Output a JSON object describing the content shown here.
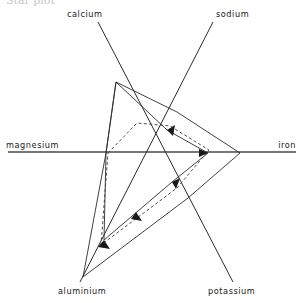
{
  "figure": {
    "title_fragment": "Star plot",
    "background_color": "#ffffff",
    "line_color": "#2b2b2b",
    "axis_color": "#4a4a4a"
  },
  "axes_labels": {
    "calcium": "calcium",
    "sodium": "sodium",
    "iron": "iron",
    "potassium": "potassium",
    "aluminium": "aluminium",
    "magnesium": "magnesium"
  },
  "chart_data": {
    "type": "line",
    "subtype": "star-plot",
    "title": "",
    "xlabel": "",
    "ylabel": "",
    "grid": false,
    "legend_position": "none",
    "center": {
      "x": 152,
      "y": 152
    },
    "axis_order": [
      "magnesium",
      "calcium",
      "sodium",
      "iron",
      "potassium",
      "aluminium"
    ],
    "axis_angles_deg": {
      "magnesium": 180,
      "calcium": 118,
      "sodium": 56,
      "iron": 0,
      "potassium": -56,
      "aluminium": -118
    },
    "axis_endpoints": {
      "magnesium": {
        "x": 8,
        "y": 152
      },
      "calcium": {
        "x": 98,
        "y": 22
      },
      "sodium": {
        "x": 213,
        "y": 22
      },
      "iron": {
        "x": 296,
        "y": 152
      },
      "potassium": {
        "x": 233,
        "y": 282
      },
      "aluminium": {
        "x": 80,
        "y": 282
      }
    },
    "categories": [
      "magnesium",
      "calcium",
      "sodium",
      "iron",
      "potassium",
      "aluminium"
    ],
    "series": [
      {
        "name": "sample-1",
        "style": "solid",
        "values": [
          0.32,
          0.74,
          0.36,
          0.61,
          0.34,
          0.97
        ],
        "points": [
          {
            "axis": "magnesium",
            "x": 106,
            "y": 153
          },
          {
            "axis": "calcium",
            "x": 116,
            "y": 82
          },
          {
            "axis": "sodium",
            "x": 177,
            "y": 112
          },
          {
            "axis": "iron",
            "x": 240,
            "y": 153
          },
          {
            "axis": "potassium",
            "x": 188,
            "y": 198
          },
          {
            "axis": "aluminium",
            "x": 83,
            "y": 277
          }
        ]
      },
      {
        "name": "sample-2",
        "style": "solid",
        "values": [
          0.32,
          0.74,
          0.14,
          0.4,
          0.22,
          0.82
        ],
        "points": [
          {
            "axis": "magnesium",
            "x": 106,
            "y": 153
          },
          {
            "axis": "calcium",
            "x": 116,
            "y": 82
          },
          {
            "axis": "sodium",
            "x": 167,
            "y": 130
          },
          {
            "axis": "iron",
            "x": 208,
            "y": 153
          },
          {
            "axis": "potassium",
            "x": 172,
            "y": 182
          },
          {
            "axis": "aluminium",
            "x": 104,
            "y": 240
          }
        ]
      },
      {
        "name": "sample-3",
        "style": "dashed",
        "values": [
          0.3,
          0.42,
          0.19,
          0.4,
          0.26,
          0.84
        ],
        "points": [
          {
            "axis": "magnesium",
            "x": 108,
            "y": 153
          },
          {
            "axis": "calcium",
            "x": 137,
            "y": 123
          },
          {
            "axis": "sodium",
            "x": 170,
            "y": 126
          },
          {
            "axis": "iron",
            "x": 209,
            "y": 150
          },
          {
            "axis": "potassium",
            "x": 177,
            "y": 188
          },
          {
            "axis": "aluminium",
            "x": 101,
            "y": 245
          }
        ]
      }
    ],
    "annotations": [
      {
        "name": "arrow-aluminium-inner",
        "x": 104,
        "y": 240,
        "angle_deg": 62
      },
      {
        "name": "arrow-potassium-inner",
        "x": 172,
        "y": 182,
        "angle_deg": 236
      },
      {
        "name": "arrow-sodium-inner",
        "x": 167,
        "y": 130,
        "angle_deg": 208
      },
      {
        "name": "arrow-iron-inner",
        "x": 208,
        "y": 153,
        "angle_deg": 180
      },
      {
        "name": "arrow-diagonal-mid",
        "x": 136,
        "y": 212,
        "angle_deg": 62
      }
    ]
  }
}
